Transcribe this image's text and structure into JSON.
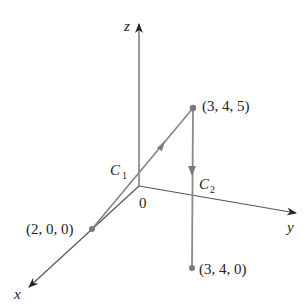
{
  "diagram": {
    "type": "3d-coordinate-paths",
    "axes": {
      "x_label": "x",
      "y_label": "y",
      "z_label": "z",
      "origin_label": "0"
    },
    "points": [
      {
        "name": "start",
        "label": "(2, 0, 0)"
      },
      {
        "name": "top",
        "label": "(3, 4, 5)"
      },
      {
        "name": "bottom",
        "label": "(3, 4, 0)"
      }
    ],
    "curves": [
      {
        "name": "C1",
        "label_main": "C",
        "label_sub": "1",
        "from": "(2, 0, 0)",
        "to": "(3, 4, 5)"
      },
      {
        "name": "C2",
        "label_main": "C",
        "label_sub": "2",
        "from": "(3, 4, 5)",
        "to": "(3, 4, 0)"
      }
    ],
    "colors": {
      "axis": "#555555",
      "curve": "#8a8a8a",
      "point": "#7a7a7a",
      "text": "#222222"
    }
  }
}
